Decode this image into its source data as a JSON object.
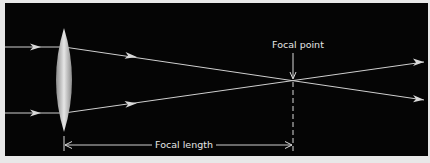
{
  "diagram": {
    "labels": {
      "focal_point": "Focal point",
      "focal_length": "Focal length"
    },
    "elements": {
      "lens": "convex-lens",
      "incoming_rays": 2,
      "outgoing_rays": 2
    },
    "colors": {
      "background": "#050505",
      "ray": "#d9d9d9",
      "lens_light": "#e0e0e0",
      "lens_dark": "#9a9a9a",
      "frame": "#e8e8e8"
    }
  }
}
